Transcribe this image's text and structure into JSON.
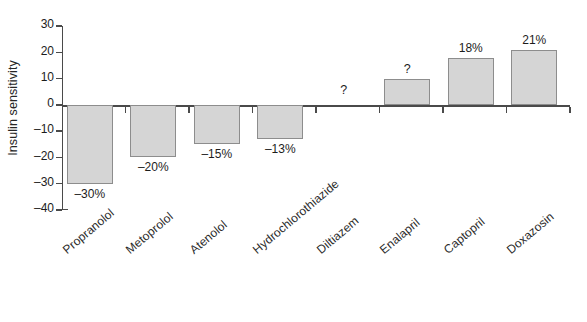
{
  "chart_data": {
    "type": "bar",
    "title": "",
    "xlabel": "",
    "ylabel": "Insulin sensitivity",
    "ylim": [
      -40,
      30
    ],
    "yticks": [
      30,
      20,
      10,
      0,
      -10,
      -20,
      -30,
      -40
    ],
    "ytick_labels": [
      "30",
      "20",
      "10",
      "0",
      "–10",
      "–20",
      "–30",
      "–40"
    ],
    "grid": false,
    "legend": null,
    "categories": [
      "Propranolol",
      "Metoprolol",
      "Atenolol",
      "Hydrochlorothiazide",
      "Diltiazem",
      "Enalapril",
      "Captopril",
      "Doxazosin"
    ],
    "values": [
      -30,
      -20,
      -15,
      -13,
      0,
      10,
      18,
      21
    ],
    "value_labels": [
      "–30%",
      "–20%",
      "–15%",
      "–13%",
      "?",
      "?",
      "18%",
      "21%"
    ],
    "unknown_flags": [
      false,
      false,
      false,
      false,
      true,
      true,
      false,
      false
    ],
    "bar_color": "#d5d5d5",
    "bar_edge_color": "#8d8d8d",
    "axis_color": "#4a4a4a",
    "text_color": "#1c1c1c",
    "background": "#ffffff"
  }
}
